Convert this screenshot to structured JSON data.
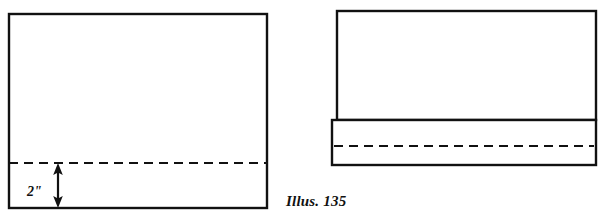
{
  "figure": {
    "caption": "Illus. 135",
    "background_color": "#ffffff",
    "line_color": "#111111",
    "panels": [
      {
        "name": "flat-fabric-panel",
        "description": "Flat rectangle of fabric with a dashed fold line two inches above the lower edge",
        "rect": {
          "x": 9,
          "y": 14,
          "width": 258,
          "height": 194
        },
        "fold_line": {
          "name": "fold-line",
          "style": "dashed",
          "y": 163,
          "x_start": 9,
          "x_end": 267
        },
        "dimension": {
          "name": "hem-depth-dimension",
          "label": "2\"",
          "value": 2,
          "unit": "inch",
          "arrow_x": 58,
          "arrow_top": 164,
          "arrow_bottom": 207,
          "label_x": 36,
          "label_y": 192
        }
      },
      {
        "name": "folded-fabric-panel",
        "description": "Same rectangle with the lower edge folded up, forming a hem band across the bottom",
        "rect": {
          "x": 337,
          "y": 11,
          "width": 259,
          "height": 109
        },
        "hem_band": {
          "name": "hem-band",
          "x": 332,
          "y": 120,
          "width": 264,
          "height": 45
        },
        "fold_line": {
          "name": "fold-line",
          "style": "dashed",
          "y": 146,
          "x_start": 332,
          "x_end": 596
        }
      }
    ]
  }
}
